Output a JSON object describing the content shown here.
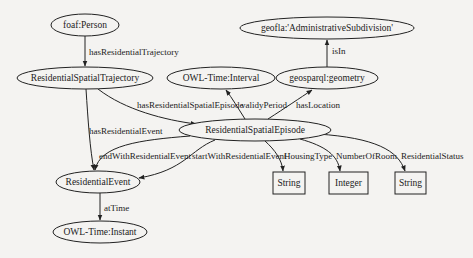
{
  "diagram": {
    "type": "ontology-graph",
    "background_color": "#f4f3f1",
    "nodes": [
      {
        "id": "person",
        "label": "foaf:Person",
        "shape": "ellipse"
      },
      {
        "id": "trajectory",
        "label": "ResidentialSpatialTrajectory",
        "shape": "ellipse"
      },
      {
        "id": "interval",
        "label": "OWL-Time:Interval",
        "shape": "ellipse"
      },
      {
        "id": "geometry",
        "label": "geosparql:geometry",
        "shape": "ellipse"
      },
      {
        "id": "adminsub",
        "label": "geofla:'AdministrativeSubdivision'",
        "shape": "ellipse"
      },
      {
        "id": "episode",
        "label": "ResidentialSpatialEpisode",
        "shape": "ellipse"
      },
      {
        "id": "event",
        "label": "ResidentialEvent",
        "shape": "ellipse"
      },
      {
        "id": "instant",
        "label": "OWL-Time:Instant",
        "shape": "ellipse"
      },
      {
        "id": "string1",
        "label": "String",
        "shape": "box"
      },
      {
        "id": "integer",
        "label": "Integer",
        "shape": "box"
      },
      {
        "id": "string2",
        "label": "String",
        "shape": "box"
      }
    ],
    "edges": [
      {
        "from": "person",
        "to": "trajectory",
        "label": "hasResidentialTrajectory"
      },
      {
        "from": "trajectory",
        "to": "episode",
        "label": "hasResidentialSpatialEpisode"
      },
      {
        "from": "trajectory",
        "to": "event",
        "label": "hasResidentialEvent"
      },
      {
        "from": "episode",
        "to": "interval",
        "label": "validyPeriod"
      },
      {
        "from": "episode",
        "to": "geometry",
        "label": "hasLocation"
      },
      {
        "from": "geometry",
        "to": "adminsub",
        "label": "isIn"
      },
      {
        "from": "episode",
        "to": "event",
        "label": "endWithResidentialEvent"
      },
      {
        "from": "episode",
        "to": "event",
        "label": "startWithResidentialEvent"
      },
      {
        "from": "episode",
        "to": "string1",
        "label": "HousingType"
      },
      {
        "from": "episode",
        "to": "integer",
        "label": "NumberOfRoom"
      },
      {
        "from": "episode",
        "to": "string2",
        "label": "ResidentialStatus"
      },
      {
        "from": "event",
        "to": "instant",
        "label": "atTime"
      }
    ]
  }
}
